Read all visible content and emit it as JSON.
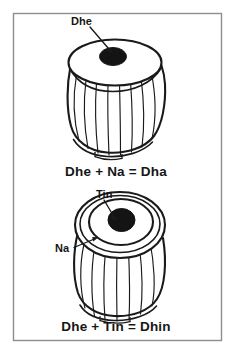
{
  "figure": {
    "background_color": "#ffffff",
    "ink_color": "#1a1a1a",
    "frame": {
      "name": "outer border",
      "color": "#8e8e8e",
      "x": 13,
      "y": 13,
      "width": 209,
      "height": 328
    },
    "panels": [
      {
        "id": "upper",
        "instrument": "tabla dayan (treble drum), three-quarter view",
        "caption": "Dhe + Na = Dha",
        "annotations": [
          {
            "label": "Dhe",
            "target": "syahi (black center patch of the drum head)",
            "label_x": 73,
            "label_y": 22,
            "arrow_from_x": 92,
            "arrow_from_y": 26,
            "arrow_to_x": 113,
            "arrow_to_y": 54
          }
        ],
        "parts": {
          "head": "elliptical playing head",
          "syahi": "off-centre black circular patch",
          "body": "barrel body with vertical lacing lines",
          "base": "flared base rim with notches"
        }
      },
      {
        "id": "lower",
        "instrument": "tabla dayan (treble drum), high-angle view",
        "caption": "Dhe + Tin = Dhin",
        "annotations": [
          {
            "label": "Tin",
            "target": "syahi (black center patch of the drum head)",
            "label_x": 97,
            "label_y": 195,
            "arrow_from_x": 104,
            "arrow_from_y": 200,
            "arrow_to_x": 116,
            "arrow_to_y": 223
          },
          {
            "label": "Na",
            "target": "kinar / outer rim of the drum head",
            "label_x": 57,
            "label_y": 250,
            "arrow_from_x": 76,
            "arrow_from_y": 246,
            "arrow_to_x": 97,
            "arrow_to_y": 237
          }
        ],
        "parts": {
          "outer_rim": "kinar, outermost ring",
          "inner_ring": "maidan, inner ring",
          "syahi": "black circular patch",
          "body": "barrel body with vertical lacing lines",
          "base": "flared base rim with notches"
        }
      }
    ]
  }
}
